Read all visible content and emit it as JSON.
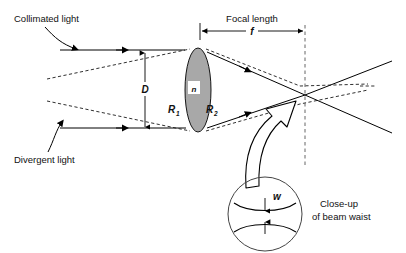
{
  "figure": {
    "background_color": "#ffffff",
    "ink_color": "#000000",
    "lens_fill_color": "#a8a8a8"
  },
  "labels": {
    "collimated_light": "Collimated light",
    "divergent_light": "Divergent light",
    "focal_length": "Focal length",
    "focal_length_symbol": "f",
    "aperture_symbol": "D",
    "refractive_index_symbol": "n",
    "radius1_symbol": "R",
    "radius1_subscript": "1",
    "radius2_symbol": "R",
    "radius2_subscript": "2",
    "beam_waist_symbol": "w",
    "closeup_line1": "Close-up",
    "closeup_line2": "of beam waist"
  },
  "geometry": {
    "lens": {
      "center_x": 198,
      "center_y": 90,
      "semi_width": 13,
      "semi_height": 42
    },
    "focal_plane_x": 305,
    "focus_point": {
      "x": 305,
      "y": 95
    },
    "optical_axis_y": 90,
    "aperture_dimension": {
      "x": 145,
      "y_top": 52,
      "y_bottom": 128
    },
    "focal_dimension": {
      "x_start": 200,
      "x_end": 305,
      "y": 31
    },
    "closeup_circle": {
      "cx": 265,
      "cy": 214,
      "r": 37
    }
  }
}
